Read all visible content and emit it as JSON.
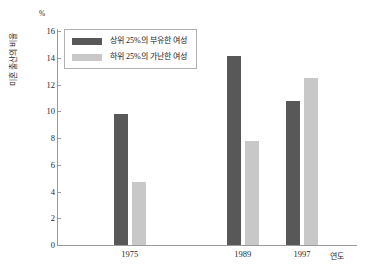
{
  "chart_data": {
    "type": "bar",
    "title": "",
    "subtitle": "",
    "xlabel": "연도",
    "ylabel": "미혼 출산의 비율",
    "yunit": "%",
    "categories": [
      "1975",
      "1989",
      "1997"
    ],
    "series": [
      {
        "name": "상위 25%의 부유한 여성",
        "color": "#585858",
        "values": [
          9.8,
          14.1,
          10.8
        ]
      },
      {
        "name": "하위 25%의 가난한 여성",
        "color": "#c8c8c8",
        "values": [
          4.7,
          7.8,
          12.5
        ]
      }
    ],
    "ylim": [
      0,
      16
    ],
    "ytick_step": 2,
    "yticks": [
      "16",
      "14",
      "12",
      "10",
      "8",
      "6",
      "4",
      "2",
      "0"
    ],
    "grid": false,
    "legend_position": "top-left"
  },
  "axes": {
    "unit_label": "%",
    "x_axis_title": "연도",
    "y_axis_title": "미혼 출산의 비율"
  },
  "legend": {
    "items": [
      {
        "label": "상위 25%의 부유한 여성",
        "color": "#585858"
      },
      {
        "label": "하위 25%의 가난한 여성",
        "color": "#c8c8c8"
      }
    ]
  }
}
